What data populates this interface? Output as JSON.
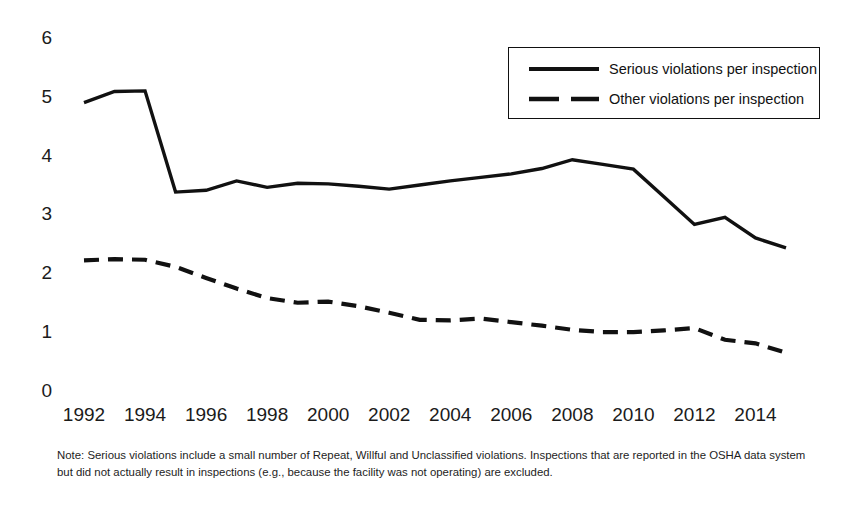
{
  "chart_data": {
    "type": "line",
    "title": "",
    "subtitle": "",
    "xlabel": "",
    "ylabel": "",
    "xlim": [
      1992,
      2015
    ],
    "ylim": [
      0,
      6
    ],
    "grid": false,
    "legend_position": "top-right",
    "x": [
      1992,
      1993,
      1994,
      1995,
      1996,
      1997,
      1998,
      1999,
      2000,
      2001,
      2002,
      2003,
      2004,
      2005,
      2006,
      2007,
      2008,
      2009,
      2010,
      2011,
      2012,
      2013,
      2014,
      2015
    ],
    "xtick_labels": [
      "1992",
      "1994",
      "1996",
      "1998",
      "2000",
      "2002",
      "2004",
      "2006",
      "2008",
      "2010",
      "2012",
      "2014"
    ],
    "xtick_values": [
      1992,
      1994,
      1996,
      1998,
      2000,
      2002,
      2004,
      2006,
      2008,
      2010,
      2012,
      2014
    ],
    "ytick_labels": [
      "0",
      "1",
      "2",
      "3",
      "4",
      "5",
      "6"
    ],
    "ytick_values": [
      0,
      1,
      2,
      3,
      4,
      5,
      6
    ],
    "series": [
      {
        "name": "Serious violations per inspection",
        "style": "solid",
        "color": "#111111",
        "values": [
          4.9,
          5.09,
          5.1,
          3.38,
          3.41,
          3.57,
          3.46,
          3.53,
          3.52,
          3.48,
          3.43,
          3.5,
          3.57,
          3.63,
          3.69,
          3.78,
          3.93,
          3.85,
          3.77,
          3.3,
          2.83,
          2.95,
          2.6,
          2.43
        ]
      },
      {
        "name": "Other violations per inspection",
        "style": "dashed",
        "color": "#111111",
        "values": [
          2.22,
          2.24,
          2.23,
          2.11,
          1.92,
          1.74,
          1.58,
          1.5,
          1.52,
          1.44,
          1.33,
          1.21,
          1.2,
          1.23,
          1.17,
          1.11,
          1.04,
          1.0,
          1.0,
          1.03,
          1.07,
          0.87,
          0.81,
          0.65
        ]
      }
    ]
  },
  "legend": {
    "entries": [
      {
        "label": "Serious violations per inspection",
        "style": "solid"
      },
      {
        "label": "Other violations per inspection",
        "style": "dashed"
      }
    ]
  },
  "note": {
    "text": "Note: Serious violations include a small number of Repeat, Willful and Unclassified violations. Inspections that are reported in the OSHA data system but did not actually result in inspections (e.g., because the facility was not operating) are excluded."
  },
  "colors": {
    "line": "#111111",
    "text": "#1b1b1b",
    "background": "#ffffff"
  }
}
